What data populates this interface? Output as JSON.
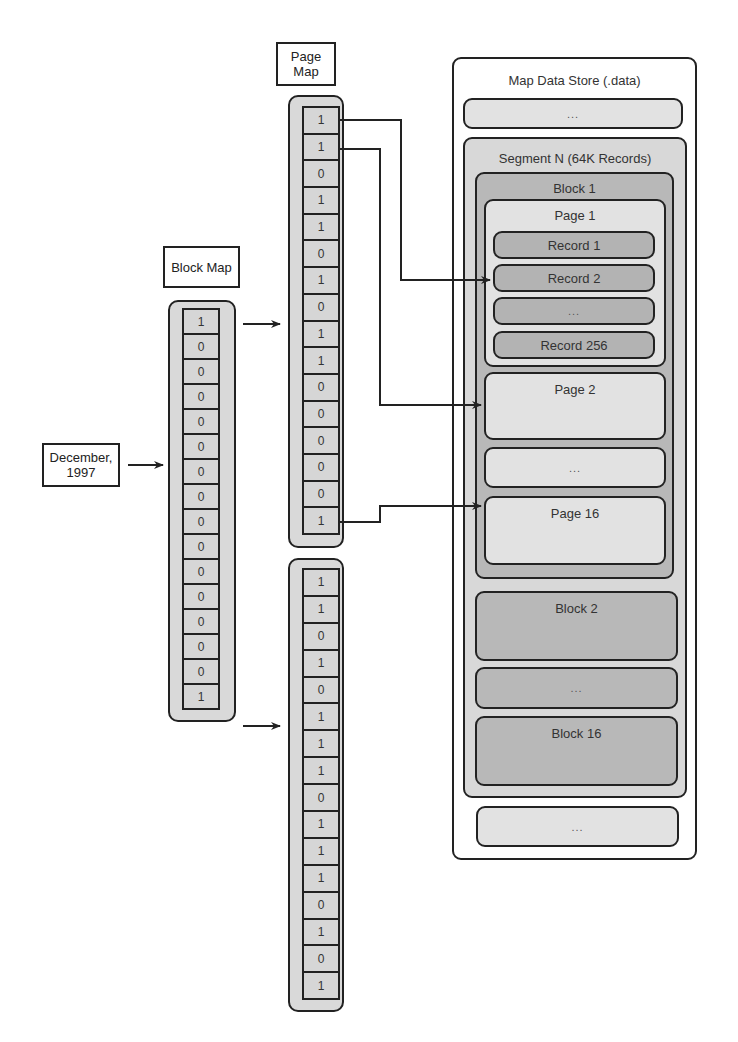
{
  "date_label": "December,\n1997",
  "block_map": {
    "title": "Block Map",
    "bits": [
      "1",
      "0",
      "0",
      "0",
      "0",
      "0",
      "0",
      "0",
      "0",
      "0",
      "0",
      "0",
      "0",
      "0",
      "0",
      "1"
    ]
  },
  "page_map": {
    "title": "Page Map",
    "upper_bits": [
      "1",
      "1",
      "0",
      "1",
      "1",
      "0",
      "1",
      "0",
      "1",
      "1",
      "0",
      "0",
      "0",
      "0",
      "0",
      "1"
    ],
    "lower_bits": [
      "1",
      "1",
      "0",
      "1",
      "0",
      "1",
      "1",
      "1",
      "0",
      "1",
      "1",
      "1",
      "0",
      "1",
      "0",
      "1"
    ]
  },
  "data_store": {
    "title": "Map Data Store (.data)",
    "top_ellipsis": "...",
    "segment": {
      "title": "Segment N (64K Records)",
      "block1": {
        "title": "Block 1",
        "page1": {
          "title": "Page 1",
          "records": [
            "Record 1",
            "Record 2",
            "...",
            "Record 256"
          ]
        },
        "page2": "Page 2",
        "pages_ellipsis": "...",
        "page16": "Page 16"
      },
      "block2": "Block 2",
      "blocks_ellipsis": "...",
      "block16": "Block 16"
    },
    "bottom_ellipsis": "..."
  },
  "colors": {
    "line": "#222222",
    "map_fill": "#d9d9d9",
    "block_fill": "#b8b8b8",
    "page_fill": "#e2e2e2",
    "record_fill": "#b3b3b3"
  }
}
